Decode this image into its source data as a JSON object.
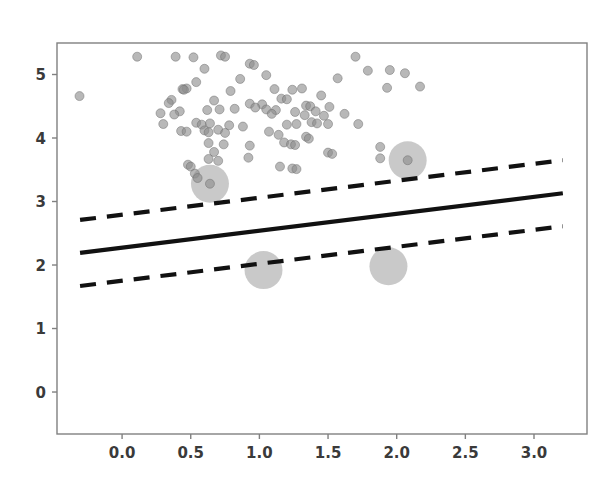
{
  "figure": {
    "title": "",
    "background_color": "#ffffff",
    "width": 608,
    "height": 483
  },
  "axes": {
    "left": 57,
    "top": 43,
    "right": 587,
    "bottom": 434,
    "spine_color": "#808080",
    "tick_label_color": "#3a3a3a",
    "x_ticks": [
      "0.0",
      "0.5",
      "1.0",
      "1.5",
      "2.0",
      "2.5",
      "3.0"
    ],
    "x_tick_values": [
      0.0,
      0.5,
      1.0,
      1.5,
      2.0,
      2.5,
      3.0
    ],
    "y_ticks": [
      "0",
      "1",
      "2",
      "3",
      "4",
      "5"
    ],
    "y_tick_values": [
      0,
      1,
      2,
      3,
      4,
      5
    ]
  },
  "chart_data": {
    "type": "scatter",
    "title": "",
    "xlabel": "",
    "ylabel": "",
    "xlim": [
      -0.474,
      3.386
    ],
    "ylim": [
      -0.661,
      5.496
    ],
    "grid": false,
    "legend": null,
    "series": [
      {
        "name": "data points",
        "marker": "circle",
        "color": "#8c8c8c",
        "edge_color": "#6e6e6e",
        "alpha": 0.62,
        "size_px": 9,
        "points": [
          [
            -0.31,
            4.66
          ],
          [
            0.11,
            5.28
          ],
          [
            0.39,
            5.28
          ],
          [
            0.52,
            5.27
          ],
          [
            0.72,
            5.3
          ],
          [
            0.75,
            5.28
          ],
          [
            1.7,
            5.28
          ],
          [
            0.6,
            5.09
          ],
          [
            0.93,
            5.17
          ],
          [
            0.96,
            5.15
          ],
          [
            1.79,
            5.06
          ],
          [
            1.95,
            5.07
          ],
          [
            2.06,
            5.02
          ],
          [
            0.86,
            4.93
          ],
          [
            1.05,
            4.99
          ],
          [
            1.57,
            4.94
          ],
          [
            0.54,
            4.88
          ],
          [
            0.47,
            4.78
          ],
          [
            0.44,
            4.77
          ],
          [
            0.45,
            4.76
          ],
          [
            0.79,
            4.74
          ],
          [
            1.11,
            4.77
          ],
          [
            1.24,
            4.76
          ],
          [
            1.31,
            4.78
          ],
          [
            1.93,
            4.79
          ],
          [
            2.17,
            4.81
          ],
          [
            0.36,
            4.6
          ],
          [
            0.67,
            4.59
          ],
          [
            1.16,
            4.62
          ],
          [
            1.2,
            4.61
          ],
          [
            1.45,
            4.67
          ],
          [
            0.34,
            4.55
          ],
          [
            0.93,
            4.54
          ],
          [
            1.02,
            4.53
          ],
          [
            1.34,
            4.51
          ],
          [
            1.37,
            4.5
          ],
          [
            1.51,
            4.49
          ],
          [
            0.42,
            4.42
          ],
          [
            0.62,
            4.44
          ],
          [
            0.71,
            4.45
          ],
          [
            0.82,
            4.46
          ],
          [
            0.97,
            4.48
          ],
          [
            1.05,
            4.45
          ],
          [
            1.12,
            4.44
          ],
          [
            1.26,
            4.41
          ],
          [
            1.41,
            4.42
          ],
          [
            0.28,
            4.39
          ],
          [
            0.38,
            4.37
          ],
          [
            1.09,
            4.38
          ],
          [
            1.33,
            4.36
          ],
          [
            1.47,
            4.35
          ],
          [
            1.62,
            4.38
          ],
          [
            0.3,
            4.22
          ],
          [
            0.54,
            4.24
          ],
          [
            0.58,
            4.21
          ],
          [
            0.64,
            4.23
          ],
          [
            0.78,
            4.2
          ],
          [
            0.88,
            4.18
          ],
          [
            1.2,
            4.21
          ],
          [
            1.27,
            4.22
          ],
          [
            1.38,
            4.25
          ],
          [
            1.42,
            4.23
          ],
          [
            1.5,
            4.22
          ],
          [
            1.72,
            4.22
          ],
          [
            0.43,
            4.11
          ],
          [
            0.47,
            4.1
          ],
          [
            0.6,
            4.12
          ],
          [
            0.63,
            4.09
          ],
          [
            0.7,
            4.13
          ],
          [
            0.75,
            4.08
          ],
          [
            1.07,
            4.1
          ],
          [
            1.14,
            4.05
          ],
          [
            1.34,
            4.02
          ],
          [
            1.36,
            3.99
          ],
          [
            0.63,
            3.92
          ],
          [
            0.74,
            3.9
          ],
          [
            0.93,
            3.88
          ],
          [
            1.18,
            3.93
          ],
          [
            1.23,
            3.9
          ],
          [
            1.26,
            3.89
          ],
          [
            0.67,
            3.78
          ],
          [
            1.5,
            3.77
          ],
          [
            1.53,
            3.75
          ],
          [
            1.88,
            3.86
          ],
          [
            0.63,
            3.67
          ],
          [
            0.92,
            3.69
          ],
          [
            0.7,
            3.64
          ],
          [
            1.88,
            3.68
          ],
          [
            0.48,
            3.58
          ],
          [
            0.5,
            3.55
          ],
          [
            1.15,
            3.55
          ],
          [
            1.24,
            3.52
          ],
          [
            1.27,
            3.51
          ],
          [
            0.53,
            3.44
          ],
          [
            0.55,
            3.37
          ]
        ]
      },
      {
        "name": "support vectors",
        "marker": "circle-halo",
        "halo_color": "#b4b4b4",
        "halo_alpha": 0.72,
        "halo_size_px": 38,
        "points": [
          {
            "x": 0.64,
            "y": 3.28,
            "has_core": true
          },
          {
            "x": 2.08,
            "y": 3.65,
            "has_core": true
          },
          {
            "x": 1.03,
            "y": 1.92,
            "has_core": false
          },
          {
            "x": 1.94,
            "y": 1.98,
            "has_core": false
          }
        ]
      }
    ],
    "lines": [
      {
        "name": "decision-boundary",
        "style": "solid",
        "color": "#111111",
        "width_px": 4.2,
        "x": [
          -0.306,
          3.21
        ],
        "y": [
          2.19,
          3.13
        ]
      },
      {
        "name": "upper-margin",
        "style": "dashed",
        "color": "#111111",
        "width_px": 4.2,
        "x": [
          -0.306,
          3.21
        ],
        "y": [
          2.71,
          3.65
        ]
      },
      {
        "name": "lower-margin",
        "style": "dashed",
        "color": "#111111",
        "width_px": 4.2,
        "x": [
          -0.306,
          3.21
        ],
        "y": [
          1.67,
          2.61
        ]
      }
    ]
  }
}
